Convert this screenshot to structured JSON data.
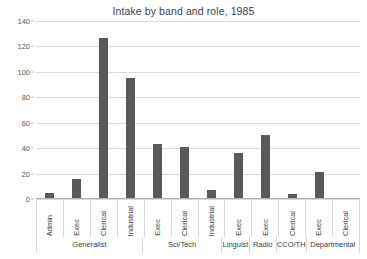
{
  "chart_data": {
    "type": "bar",
    "title": "Intake by band and role, 1985",
    "xlabel": "",
    "ylabel": "",
    "ylim": [
      0,
      140
    ],
    "yticks": [
      0,
      20,
      40,
      60,
      80,
      100,
      120,
      140
    ],
    "ytick_labels": [
      "0",
      "20",
      "40",
      "60",
      "80",
      "100",
      "120",
      "140"
    ],
    "grid": true,
    "legend": "none",
    "bar_color": "#595959",
    "gridline_color": "#d9d9d9",
    "categories": [
      "Admin",
      "Exec",
      "Clerical",
      "Industrial",
      "Exec",
      "Clerical",
      "Industrial",
      "Exec",
      "Exec",
      "Clerical",
      "Exec",
      "Clerical"
    ],
    "values": [
      5,
      16,
      127,
      95,
      43,
      41,
      7,
      36,
      50,
      4,
      21,
      1
    ],
    "groups": [
      {
        "label": "Generalist",
        "span": 4
      },
      {
        "label": "Sci/Tech",
        "span": 3
      },
      {
        "label": "Linguist",
        "span": 1
      },
      {
        "label": "Radio",
        "span": 1
      },
      {
        "label": "CCO/TH",
        "span": 1
      },
      {
        "label": "Departmental",
        "span": 2
      }
    ],
    "bars": [
      {
        "group": "Generalist",
        "role": "Admin",
        "value": 5
      },
      {
        "group": "Generalist",
        "role": "Exec",
        "value": 16
      },
      {
        "group": "Generalist",
        "role": "Clerical",
        "value": 127
      },
      {
        "group": "Generalist",
        "role": "Industrial",
        "value": 95
      },
      {
        "group": "Sci/Tech",
        "role": "Exec",
        "value": 43
      },
      {
        "group": "Sci/Tech",
        "role": "Clerical",
        "value": 41
      },
      {
        "group": "Sci/Tech",
        "role": "Industrial",
        "value": 7
      },
      {
        "group": "Linguist",
        "role": "Exec",
        "value": 36
      },
      {
        "group": "Radio",
        "role": "Exec",
        "value": 50
      },
      {
        "group": "CCO/TH",
        "role": "Clerical",
        "value": 4
      },
      {
        "group": "Departmental",
        "role": "Exec",
        "value": 21
      },
      {
        "group": "Departmental",
        "role": "Clerical",
        "value": 1
      }
    ]
  }
}
